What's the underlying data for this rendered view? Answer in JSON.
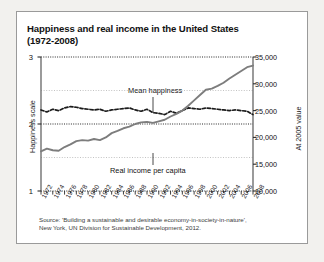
{
  "card": {
    "title_line1": "Happiness and real income in the United States",
    "title_line2": "(1972-2008)",
    "source_line1": "Source: 'Building a sustainable and desirable economy-in-society-in-nature',",
    "source_line2": "New York, UN Division for Sustainable Development, 2012."
  },
  "annotations": {
    "happiness_label": "Mean happiness",
    "income_label": "Real income per capita"
  },
  "chart_data": {
    "type": "line",
    "title": "Happiness and real income in the United States (1972-2008)",
    "xlabel": "",
    "ylabel": "Happiness scale",
    "ylabel_right": "At 2005 value",
    "xlim": [
      1972,
      2008
    ],
    "ylim": [
      1,
      3
    ],
    "ylim_right": [
      10000,
      35000
    ],
    "yticks": [
      1,
      2,
      3
    ],
    "ytick_labels": [
      "1",
      "2",
      "3"
    ],
    "yticks_right": [
      10000,
      15000,
      20000,
      25000,
      30000,
      35000
    ],
    "ytick_labels_right": [
      "10,000",
      "15,000",
      "20,000",
      "25,000",
      "30,000",
      "35,000"
    ],
    "gridlines_minor": [
      1.5,
      2.5
    ],
    "grid": true,
    "legend": "inline-annotations",
    "xticks": [
      1972,
      1974,
      1976,
      1978,
      1980,
      1982,
      1984,
      1986,
      1988,
      1990,
      1992,
      1994,
      1996,
      1998,
      2000,
      2002,
      2004,
      2006,
      2008
    ],
    "xtick_labels": [
      "1972",
      "1974",
      "1976",
      "1978",
      "1980",
      "1982",
      "1984",
      "1986",
      "1988",
      "1990",
      "1992",
      "1994",
      "1996",
      "1998",
      "2000",
      "2002",
      "2004",
      "2006",
      "2008"
    ],
    "x": [
      1972,
      1973,
      1974,
      1975,
      1976,
      1977,
      1978,
      1979,
      1980,
      1981,
      1982,
      1983,
      1984,
      1985,
      1986,
      1987,
      1988,
      1989,
      1990,
      1991,
      1992,
      1993,
      1994,
      1995,
      1996,
      1997,
      1998,
      1999,
      2000,
      2001,
      2002,
      2003,
      2004,
      2005,
      2006,
      2007,
      2008
    ],
    "series": [
      {
        "name": "Mean happiness",
        "axis": "left",
        "style": "dashed",
        "color": "#1b1b1b",
        "values": [
          2.21,
          2.18,
          2.22,
          2.2,
          2.24,
          2.26,
          2.25,
          2.23,
          2.22,
          2.21,
          2.22,
          2.19,
          2.21,
          2.22,
          2.23,
          2.24,
          2.21,
          2.19,
          2.22,
          2.17,
          2.16,
          2.14,
          2.19,
          2.16,
          2.2,
          2.24,
          2.23,
          2.22,
          2.24,
          2.23,
          2.22,
          2.21,
          2.2,
          2.21,
          2.2,
          2.19,
          2.14
        ]
      },
      {
        "name": "Real income per capita",
        "axis": "right",
        "style": "solid",
        "color": "#7d7d7d",
        "values": [
          17400,
          17900,
          17600,
          17500,
          18200,
          18700,
          19300,
          19500,
          19400,
          19700,
          19500,
          20000,
          20800,
          21200,
          21700,
          22000,
          22500,
          22800,
          22900,
          22700,
          23000,
          23300,
          23900,
          24400,
          25000,
          25900,
          26900,
          27900,
          28900,
          29100,
          29600,
          30200,
          31000,
          31700,
          32400,
          33100,
          33400
        ]
      }
    ]
  }
}
